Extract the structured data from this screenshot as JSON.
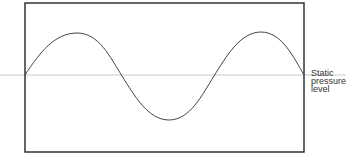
{
  "diagram": {
    "type": "waveform",
    "labels": {
      "baseline_line1": "Static",
      "baseline_line2": "pressure",
      "baseline_line3": "level"
    },
    "colors": {
      "frame": "#333333",
      "wave": "#444444",
      "baseline": "#bbbbbb",
      "background": "#ffffff"
    },
    "geometry": {
      "frame": {
        "x": 25,
        "y": 3,
        "width": 279,
        "height": 149
      },
      "baseline_y": 75,
      "wave_points": [
        {
          "x": 25,
          "y": 75
        },
        {
          "x": 77,
          "y": 33
        },
        {
          "x": 122,
          "y": 76
        },
        {
          "x": 169,
          "y": 120
        },
        {
          "x": 214,
          "y": 76
        },
        {
          "x": 261,
          "y": 32
        },
        {
          "x": 304,
          "y": 75
        }
      ]
    }
  }
}
